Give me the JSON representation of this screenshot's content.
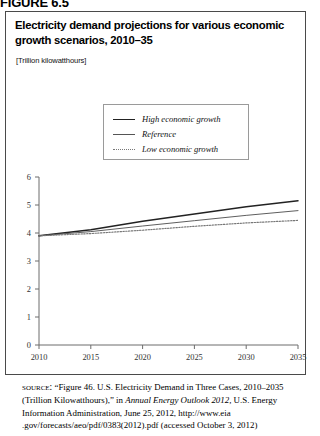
{
  "figure_label": "FIGURE 6.5",
  "chart": {
    "title": "Electricity demand projections for various economic growth scenarios, 2010–35",
    "units": "[Trillion kilowatthours]",
    "legend": [
      {
        "label": "High economic growth",
        "style": "solid-thick",
        "swatch": "sw-high"
      },
      {
        "label": "Reference",
        "style": "solid-thin",
        "swatch": "sw-ref"
      },
      {
        "label": "Low economic growth",
        "style": "dotted",
        "swatch": "sw-low"
      }
    ]
  },
  "source": {
    "kicker": "source:",
    "part1": " “Figure 46. U.S. Electricity Demand in Three Cases, 2010–2035 (Trillion Kilowatthours),” in ",
    "italic": "Annual Energy Outlook 2012,",
    "part2": " U.S. Energy Information Administration, June 25, 2012, http://www.eia .gov/forecasts/aeo/pdf/0383(2012).pdf (accessed October 3, 2012)"
  },
  "chart_data": {
    "type": "line",
    "title": "Electricity demand projections for various economic growth scenarios, 2010–35",
    "xlabel": "",
    "ylabel": "",
    "units": "Trillion kilowatthours",
    "grid": false,
    "legend_position": "upper-center",
    "xlim": [
      2010,
      2035
    ],
    "ylim": [
      0,
      6
    ],
    "yticks": [
      0,
      1,
      2,
      3,
      4,
      5,
      6
    ],
    "xticks": [
      2010,
      2015,
      2020,
      2025,
      2030,
      2035
    ],
    "x": [
      2010,
      2015,
      2020,
      2025,
      2030,
      2035
    ],
    "series": [
      {
        "name": "High economic growth",
        "values": [
          3.9,
          4.12,
          4.42,
          4.68,
          4.94,
          5.15
        ]
      },
      {
        "name": "Reference",
        "values": [
          3.9,
          4.05,
          4.25,
          4.44,
          4.63,
          4.8
        ]
      },
      {
        "name": "Low economic growth",
        "values": [
          3.9,
          3.98,
          4.1,
          4.24,
          4.36,
          4.45
        ]
      }
    ]
  },
  "colors": {
    "frame": "#4a4a4a",
    "axis": "#6d6d6d",
    "high": "#222222",
    "reference": "#555555",
    "low": "#777777"
  }
}
